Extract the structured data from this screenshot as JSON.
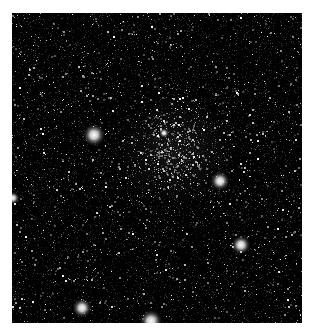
{
  "image": {
    "subject": "Star cluster in dense star field",
    "background_color": "#020202",
    "frame": {
      "x": 12,
      "y": 13,
      "width": 290,
      "height": 310
    },
    "cluster": {
      "center_x": 163,
      "center_y": 137,
      "radius": 42,
      "core_x": 153,
      "core_y": 122
    },
    "bright_stars": [
      {
        "x": 82,
        "y": 122,
        "r": 7
      },
      {
        "x": 208,
        "y": 168,
        "r": 6
      },
      {
        "x": 229,
        "y": 232,
        "r": 6
      },
      {
        "x": 70,
        "y": 295,
        "r": 6
      },
      {
        "x": 139,
        "y": 308,
        "r": 7
      },
      {
        "x": 1,
        "y": 185,
        "r": 4
      },
      {
        "x": 152,
        "y": 120,
        "r": 3
      }
    ],
    "field_star_count": 2200,
    "cluster_star_count": 420
  }
}
